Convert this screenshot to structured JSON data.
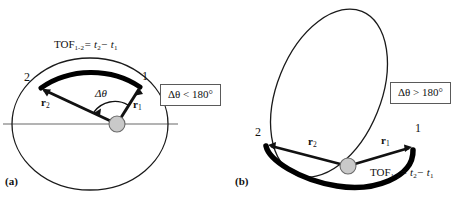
{
  "figure": {
    "colors": {
      "orbit_line": "#1a1a1a",
      "transfer_arc": "#000000",
      "apse_line": "#9a9a9a",
      "focus_fill": "#c9c9c9",
      "box_border": "#5a5a5a",
      "background": "#ffffff"
    }
  },
  "panels": [
    {
      "tag": "(a)",
      "tag_name": "panel-a",
      "tof_label": "TOF",
      "tof_sub": "1-2",
      "tof_equals": "= t",
      "tof_t2_sub": "2",
      "tof_minus": "− t",
      "tof_t1_sub": "1",
      "point1": "1",
      "point2": "2",
      "r1": "r",
      "r1_sub": "1",
      "r2": "r",
      "r2_sub": "2",
      "delta_theta": "Δθ",
      "condition": "Δθ < 180°",
      "orbit_shape": "near-circular ellipse",
      "arc_description": "thick transfer arc along upper boundary from point 1 to point 2, short way"
    },
    {
      "tag": "(b)",
      "tag_name": "panel-b",
      "tof_label": "TOF",
      "tof_sub": "1-2",
      "tof_equals": "= t",
      "tof_t2_sub": "2",
      "tof_minus": "− t",
      "tof_t1_sub": "1",
      "point1": "1",
      "point2": "2",
      "r1": "r",
      "r1_sub": "1",
      "r2": "r",
      "r2_sub": "2",
      "condition": "Δθ > 180°",
      "orbit_shape": "tilted elongated ellipse",
      "arc_description": "thick transfer arc sweeping below focus from point 1 to point 2, long way"
    }
  ]
}
